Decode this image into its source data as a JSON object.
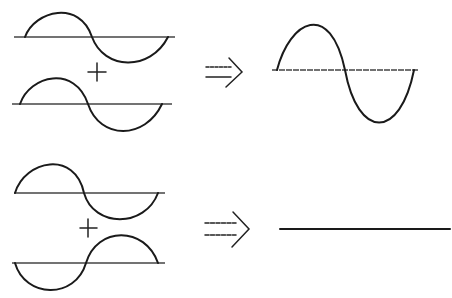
{
  "diagram": {
    "colors": {
      "stroke": "#1a1a1a",
      "axis": "#444444",
      "background": "#ffffff"
    },
    "rows": [
      {
        "name": "constructive-interference",
        "operator": "+",
        "result_symbol": "⇒",
        "inputs": [
          {
            "name": "wave-a",
            "phase": "in-phase",
            "amplitude": 1
          },
          {
            "name": "wave-b",
            "phase": "in-phase",
            "amplitude": 1
          }
        ],
        "result": {
          "name": "sum-wave",
          "amplitude": 2,
          "description": "larger amplitude sine wave"
        }
      },
      {
        "name": "destructive-interference",
        "operator": "+",
        "result_symbol": "⇒",
        "inputs": [
          {
            "name": "wave-a",
            "phase": "0",
            "amplitude": 1
          },
          {
            "name": "wave-b",
            "phase": "180° (inverted)",
            "amplitude": 1
          }
        ],
        "result": {
          "name": "flat-line",
          "amplitude": 0,
          "description": "waves cancel, flat line"
        }
      }
    ]
  }
}
